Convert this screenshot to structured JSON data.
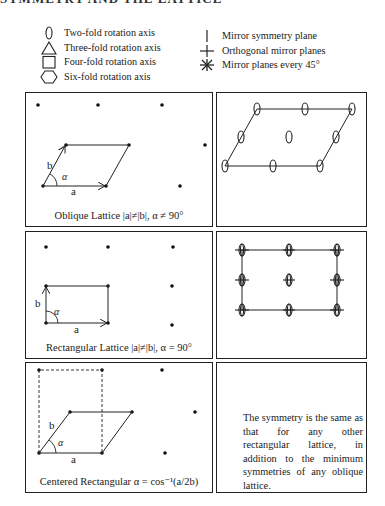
{
  "heading": "SYMMETRY AND THE LATTICE",
  "legend": {
    "left": [
      {
        "icon": "ellipse-two-fold-icon",
        "label": "Two-fold rotation axis"
      },
      {
        "icon": "triangle-three-fold-icon",
        "label": "Three-fold rotation axis"
      },
      {
        "icon": "square-four-fold-icon",
        "label": "Four-fold rotation axis"
      },
      {
        "icon": "hexagon-six-fold-icon",
        "label": "Six-fold rotation axis"
      }
    ],
    "right": [
      {
        "icon": "vertical-line-mirror-icon",
        "label": "Mirror symmetry plane"
      },
      {
        "icon": "cross-orthogonal-mirror-icon",
        "label": "Orthogonal mirror planes"
      },
      {
        "icon": "asterisk-mirror-45-icon",
        "label": "Mirror planes every 45°"
      }
    ]
  },
  "panels": {
    "oblique": {
      "caption": "Oblique Lattice |a|≠|b|, α ≠ 90°",
      "vec_a": "a",
      "vec_b": "b",
      "angle": "α"
    },
    "rectangular": {
      "caption": "Rectangular Lattice |a|≠|b|, α = 90°",
      "vec_a": "a",
      "vec_b": "b",
      "angle": "α"
    },
    "centered": {
      "caption": "Centered Rectangular α = cos⁻¹(a/2b)",
      "vec_a": "a",
      "vec_b": "b",
      "angle": "α",
      "note": "The symmetry is the same as that for any other rectangular lattice, in addition to the minimum symmetries of any oblique lattice."
    }
  }
}
